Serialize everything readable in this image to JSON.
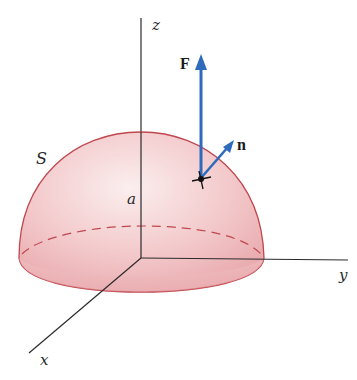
{
  "figure": {
    "type": "hemisphere-surface-flux",
    "labels": {
      "z_axis": "z",
      "y_axis": "y",
      "x_axis": "x",
      "surface": "S",
      "radius": "a",
      "force_vector": "F",
      "normal_vector": "n"
    },
    "colors": {
      "surface_fill": "#f2c4c6",
      "surface_edge": "#c0474f",
      "vector": "#2f6bbd",
      "axis": "#2b2b2b"
    }
  }
}
